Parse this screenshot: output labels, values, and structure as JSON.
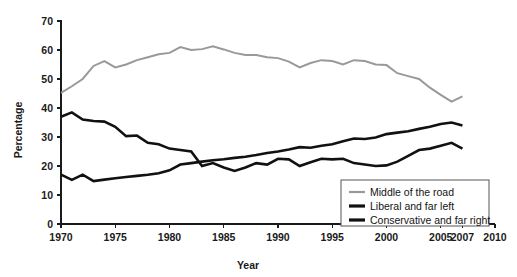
{
  "chart_data": {
    "type": "line",
    "title": "",
    "xlabel": "Year",
    "ylabel": "Percentage",
    "xlim": [
      1970,
      2010
    ],
    "ylim": [
      0,
      70
    ],
    "xticks": [
      1970,
      1975,
      1980,
      1985,
      1990,
      1995,
      2000,
      2005,
      2007,
      2010
    ],
    "xtick_labels": [
      "1970",
      "1975",
      "1980",
      "1985",
      "1990",
      "1995",
      "2000",
      "2005",
      "2007",
      "2010"
    ],
    "yticks": [
      0,
      10,
      20,
      30,
      40,
      50,
      60,
      70
    ],
    "ytick_labels": [
      "0",
      "10",
      "20",
      "30",
      "40",
      "50",
      "60",
      "70"
    ],
    "grid": false,
    "legend_position": "bottom-right",
    "x": [
      1970,
      1971,
      1972,
      1973,
      1974,
      1975,
      1976,
      1977,
      1978,
      1979,
      1980,
      1981,
      1982,
      1983,
      1984,
      1985,
      1986,
      1987,
      1988,
      1989,
      1990,
      1991,
      1992,
      1993,
      1994,
      1995,
      1996,
      1997,
      1998,
      1999,
      2000,
      2001,
      2002,
      2003,
      2004,
      2005,
      2006,
      2007
    ],
    "series": [
      {
        "name": "Middle of the road",
        "color": "#999999",
        "width": 2.0,
        "values": [
          45.2,
          47.5,
          50.0,
          54.5,
          56.2,
          54.0,
          55.0,
          56.5,
          57.5,
          58.5,
          59.0,
          61.0,
          60.0,
          60.3,
          61.3,
          60.2,
          59.0,
          58.3,
          58.3,
          57.5,
          57.2,
          56.0,
          54.0,
          55.5,
          56.5,
          56.2,
          55.0,
          56.5,
          56.2,
          55.0,
          54.8,
          52.0,
          51.0,
          50.0,
          47.0,
          44.5,
          42.2,
          44.0
        ]
      },
      {
        "name": "Liberal and far left",
        "color": "#111111",
        "width": 2.6,
        "values": [
          17.0,
          15.2,
          17.0,
          14.8,
          15.3,
          15.8,
          16.2,
          16.6,
          17.0,
          17.5,
          18.5,
          20.5,
          21.0,
          21.5,
          22.0,
          22.3,
          22.8,
          23.2,
          23.8,
          24.5,
          25.0,
          25.7,
          26.5,
          26.3,
          27.0,
          27.5,
          28.5,
          29.5,
          29.3,
          29.8,
          31.0,
          31.5,
          32.0,
          32.8,
          33.5,
          34.5,
          35.0,
          34.0
        ]
      },
      {
        "name": "Conservative and far right",
        "color": "#111111",
        "width": 2.6,
        "values": [
          37.0,
          38.5,
          36.0,
          35.5,
          35.3,
          33.5,
          30.3,
          30.5,
          28.0,
          27.5,
          26.0,
          25.5,
          25.0,
          20.0,
          21.0,
          19.5,
          18.3,
          19.5,
          21.0,
          20.5,
          22.5,
          22.3,
          20.0,
          21.3,
          22.5,
          22.3,
          22.5,
          21.0,
          20.5,
          20.0,
          20.2,
          21.5,
          23.5,
          25.5,
          26.0,
          27.0,
          28.0,
          26.0
        ]
      }
    ]
  },
  "legend": {
    "entries": [
      {
        "label": "Middle of the road",
        "color": "#999999",
        "thickness": 2.2
      },
      {
        "label": "Liberal and far left",
        "color": "#111111",
        "thickness": 3.2
      },
      {
        "label": "Conservative and far right",
        "color": "#111111",
        "thickness": 3.2
      }
    ]
  },
  "axes": {
    "y_title": "Percentage",
    "x_title": "Year"
  }
}
